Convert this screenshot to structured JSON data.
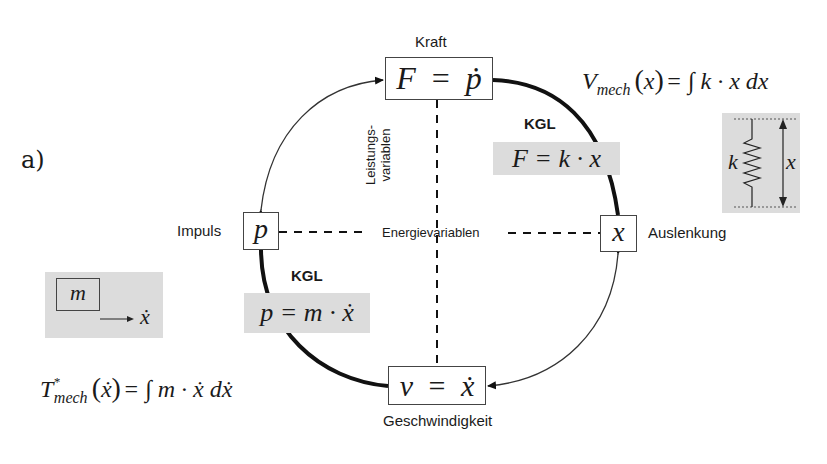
{
  "panel_label": "a)",
  "nodes": {
    "kraft": {
      "label": "Kraft",
      "formula_lhs": "F",
      "formula_op": "=",
      "formula_rhs": "ṗ"
    },
    "impuls": {
      "label": "Impuls",
      "formula": "p"
    },
    "auslenkung": {
      "label": "Auslenkung",
      "formula": "x"
    },
    "geschwindigkeit": {
      "label": "Geschwindigkeit",
      "formula_lhs": "v",
      "formula_op": "=",
      "formula_rhs": "ẋ"
    }
  },
  "axes": {
    "vertical_label_line1": "Leistungs-",
    "vertical_label_line2": "variablen",
    "horizontal_label": "Energievariablen"
  },
  "constitutive_relations": {
    "spring": {
      "tag": "KGL",
      "formula": "F = k · x"
    },
    "mass": {
      "tag": "KGL",
      "formula": "p = m · ẋ"
    }
  },
  "energy_functions": {
    "potential": {
      "symbol": "V",
      "subscript": "mech",
      "argument": "x",
      "rhs": "= ∫ k · x dx"
    },
    "kinetic_coenergy": {
      "symbol": "T",
      "superscript": "*",
      "subscript": "mech",
      "argument": "ẋ",
      "rhs": "= ∫ m · ẋ dẋ"
    }
  },
  "spring_sketch": {
    "stiffness_symbol": "k",
    "displacement_symbol": "x"
  },
  "mass_sketch": {
    "mass_symbol": "m",
    "velocity_symbol": "ẋ"
  },
  "colors": {
    "line": "#111111",
    "box_border": "#444444",
    "highlight_fill": "#dcdcdc"
  }
}
